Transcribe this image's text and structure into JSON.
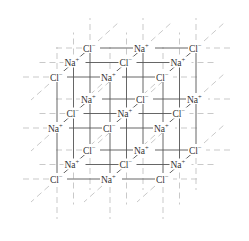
{
  "diagram": {
    "colors": {
      "solid_line": "#555555",
      "dashed_line": "#bbbbbb",
      "text": "#333333",
      "background": "#ffffff"
    },
    "ion_labels": {
      "Na": "Na",
      "Na_charge": "+",
      "Cl": "Cl",
      "Cl_charge": "−"
    },
    "grid": {
      "x_step": 53,
      "depth_dx": -16.5,
      "depth_dy": 14.5,
      "layer_dy": 51,
      "origin_x": 90,
      "origin_y": 48
    },
    "layers": [
      {
        "name": "top",
        "rows": [
          [
            "Cl",
            "Na",
            "Cl"
          ],
          [
            "Na",
            "Cl",
            "Na"
          ],
          [
            "Cl",
            "Na",
            "Cl"
          ]
        ]
      },
      {
        "name": "middle",
        "rows": [
          [
            "Na",
            "Cl",
            "Na"
          ],
          [
            "Cl",
            "Na",
            "Cl"
          ],
          [
            "Na",
            "Cl",
            "Na"
          ]
        ]
      },
      {
        "name": "bottom",
        "rows": [
          [
            "Cl",
            "Na",
            "Cl"
          ],
          [
            "Na",
            "Cl",
            "Na"
          ],
          [
            "Cl",
            "Na",
            "Cl"
          ]
        ]
      }
    ]
  }
}
